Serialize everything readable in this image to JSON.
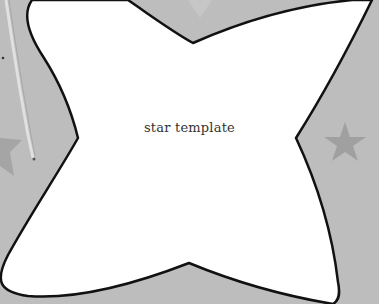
{
  "template": {
    "label": "star template"
  },
  "colors": {
    "background": "#bdbdbd",
    "background_star": "#a2a2a2",
    "shape_fill": "#ffffff",
    "shape_outline": "#111111",
    "stick": "#d9d9d9"
  }
}
